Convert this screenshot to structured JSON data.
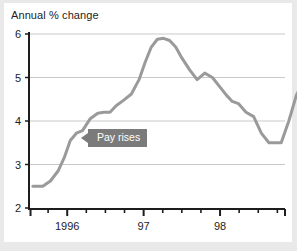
{
  "chart_data": {
    "type": "line",
    "title": "Annual % change",
    "xlabel": "",
    "ylabel": "",
    "ylim": [
      2,
      6
    ],
    "yticks": [
      2,
      3,
      4,
      5,
      6
    ],
    "ytick_labels": [
      "2",
      "3",
      "4",
      "5",
      "6"
    ],
    "xlim": [
      1995.5,
      1998.85
    ],
    "xticks": [
      1996,
      1997,
      1998
    ],
    "xtick_labels": [
      "1996",
      "97",
      "98"
    ],
    "minor_xticks": [
      1995.75,
      1996.25,
      1996.5,
      1996.75,
      1997.25,
      1997.5,
      1997.75,
      1998.25,
      1998.5,
      1998.75
    ],
    "grid": "horizontal",
    "legend": "none",
    "line_color": "#9a9a9a",
    "annotations": [
      {
        "text": "Pay rises",
        "x": 1996.18,
        "y": 3.62,
        "style": "grey-callout-left-arrow"
      }
    ],
    "series": [
      {
        "name": "Pay rises",
        "x": [
          1995.55,
          1995.68,
          1995.78,
          1995.88,
          1995.96,
          1996.04,
          1996.12,
          1996.2,
          1996.3,
          1996.4,
          1996.48,
          1996.56,
          1996.64,
          1996.74,
          1996.84,
          1996.94,
          1997.02,
          1997.1,
          1997.18,
          1997.26,
          1997.34,
          1997.42,
          1997.5,
          1997.6,
          1997.7,
          1997.8,
          1997.9,
          1998.0,
          1998.08,
          1998.16,
          1998.24,
          1998.34,
          1998.44,
          1998.54,
          1998.64,
          1998.74,
          1998.8
        ],
        "values": [
          2.5,
          2.5,
          2.62,
          2.85,
          3.15,
          3.55,
          3.72,
          3.78,
          4.05,
          4.18,
          4.2,
          4.2,
          4.35,
          4.48,
          4.62,
          4.95,
          5.35,
          5.7,
          5.88,
          5.9,
          5.85,
          5.7,
          5.45,
          5.18,
          4.95,
          5.1,
          5.0,
          4.78,
          4.6,
          4.45,
          4.4,
          4.2,
          4.1,
          3.72,
          3.5,
          3.5,
          3.5
        ]
      }
    ],
    "series_tail": {
      "x": [
        1998.8,
        1998.9,
        1999.0,
        1999.12,
        1999.24,
        1999.3
      ],
      "values": [
        3.5,
        4.0,
        4.6,
        5.0,
        5.2,
        4.5
      ]
    }
  },
  "annotation_box": {
    "label": "Pay rises"
  }
}
